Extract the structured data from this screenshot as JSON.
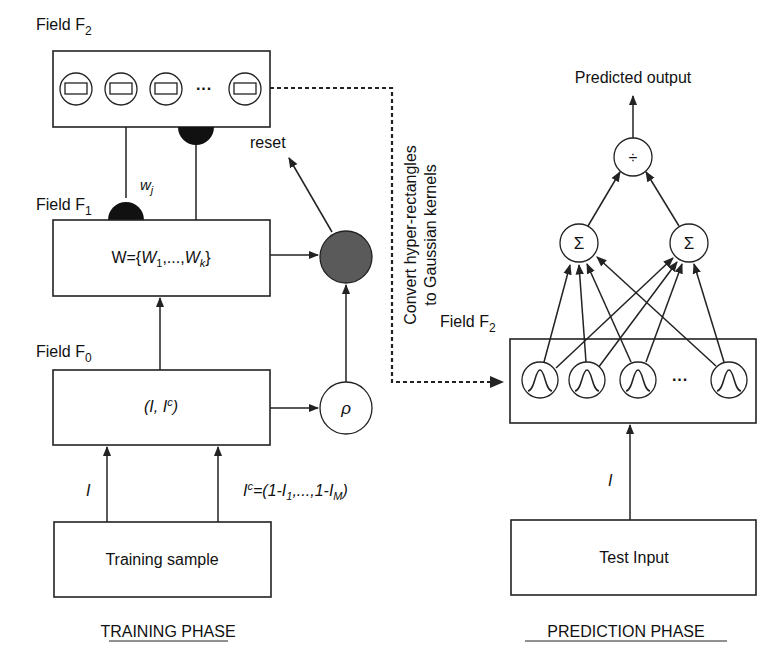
{
  "training": {
    "field_f2_label": "Field F",
    "field_f2_sub": "2",
    "field_f1_label": "Field F",
    "field_f1_sub": "1",
    "field_f0_label": "Field F",
    "field_f0_sub": "0",
    "weight_label": "w",
    "weight_sub": "j",
    "f1_content_prefix": "W={",
    "f1_content_w1": "W",
    "f1_content_w1_sub": "1",
    "f1_content_mid": ",...,",
    "f1_content_wk": "W",
    "f1_content_wk_sub": "k",
    "f1_content_suffix": "}",
    "f0_content": "(I, I",
    "f0_content_sup": "c",
    "f0_content_end": ")",
    "reset_label": "reset",
    "rho_label": "ρ",
    "input_label": "I",
    "complement_main": "I",
    "complement_sup": "c",
    "complement_eq": "=(1-I",
    "complement_sub1": "1",
    "complement_mid": ",...,1-I",
    "complement_subM": "M",
    "complement_end": ")",
    "sample_label": "Training sample",
    "phase_label": "TRAINING PHASE",
    "f2_node_ellipsis": "···"
  },
  "connector": {
    "line1": "Convert hyper-rectangles",
    "line2": "to Gaussian kernels"
  },
  "prediction": {
    "output_label": "Predicted output",
    "divide_symbol": "÷",
    "sum_symbol_left": "Σ",
    "sum_symbol_right": "Σ",
    "field_f2_label": "Field F",
    "field_f2_sub": "2",
    "input_label": "I",
    "test_input_label": "Test Input",
    "phase_label": "PREDICTION PHASE",
    "kernel_ellipsis": "···"
  },
  "colors": {
    "line": "#222222",
    "vigilance_node": "#5a5a5a",
    "synapse": "#111111"
  }
}
